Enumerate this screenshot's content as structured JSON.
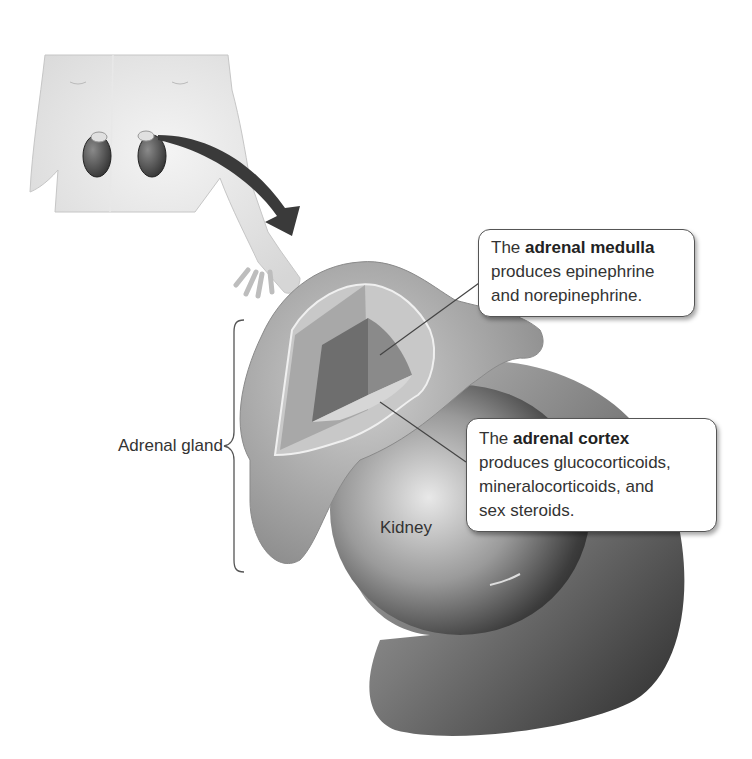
{
  "figure": {
    "inset": {
      "description": "Torso showing position of the kidneys and adrenal glands"
    },
    "labels": {
      "adrenal_gland": "Adrenal gland",
      "kidney": "Kidney"
    },
    "callouts": {
      "medulla": {
        "prefix": "The ",
        "term": "adrenal medulla",
        "line1_rest": "",
        "line2": "produces epinephrine",
        "line3": "and norepinephrine."
      },
      "cortex": {
        "prefix": "The ",
        "term": "adrenal cortex",
        "line2": "produces glucocorticoids,",
        "line3": "mineralocorticoids, and",
        "line4": "sex steroids."
      }
    },
    "colors": {
      "arrow": "#3a3a3a",
      "kidney_dark": "#2e2e2e",
      "gland_outer": "#9a9a9a",
      "cortex": "#c8c8c8",
      "medulla": "#6e6e6e"
    }
  }
}
